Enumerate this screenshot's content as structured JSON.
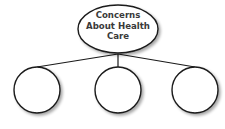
{
  "diagram": {
    "root": {
      "label_lines": [
        "Concerns",
        "About Health",
        "Care"
      ]
    },
    "children": [
      {
        "label": ""
      },
      {
        "label": ""
      },
      {
        "label": ""
      }
    ],
    "colors": {
      "stroke": "#1a1a1a",
      "fill": "#ffffff",
      "text": "#3a3a3a",
      "shadow": "#bbbbbb"
    }
  }
}
